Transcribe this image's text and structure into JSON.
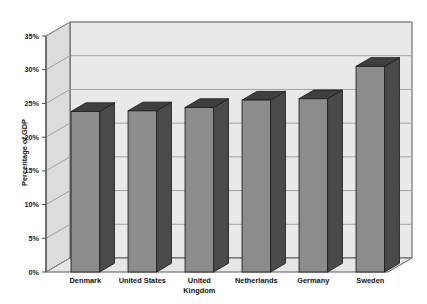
{
  "chart_data": {
    "type": "bar",
    "title": "",
    "subtitle": "",
    "xlabel": "",
    "ylabel": "Percentage of GDP",
    "categories": [
      "Denmark",
      "United States",
      "United Kingdom",
      "Netherlands",
      "Germany",
      "Sweden"
    ],
    "values": [
      23.8,
      23.9,
      24.4,
      25.5,
      25.7,
      30.5
    ],
    "ylim": [
      0,
      35
    ],
    "ytick_labels": [
      "0%",
      "5%",
      "10%",
      "15%",
      "20%",
      "25%",
      "30%",
      "35%"
    ],
    "ytick_values": [
      0,
      5,
      10,
      15,
      20,
      25,
      30,
      35
    ],
    "grid": true,
    "legend": false,
    "legend_position": "none",
    "style": "3d-column",
    "colors": {
      "bar_front": "#8c8c8c",
      "bar_side": "#4a4a4a",
      "bar_top": "#3f3f3f",
      "bar_outline": "#1f1f1f",
      "plot_back_wall": "#e8e8e6",
      "plot_left_wall": "#d8d8d6",
      "plot_floor": "#e4e4e2",
      "gridline": "#9a9a9a",
      "axis_line": "#4d4d4d",
      "background": "#ffffff",
      "text": "#111111"
    }
  },
  "axis": {
    "y_title": "Percentage of GDP",
    "ticks": [
      {
        "label": "35%",
        "value": 35
      },
      {
        "label": "30%",
        "value": 30
      },
      {
        "label": "25%",
        "value": 25
      },
      {
        "label": "20%",
        "value": 20
      },
      {
        "label": "15%",
        "value": 15
      },
      {
        "label": "10%",
        "value": 10
      },
      {
        "label": "5%",
        "value": 5
      },
      {
        "label": "0%",
        "value": 0
      }
    ]
  },
  "categories": [
    {
      "line1": "Denmark",
      "line2": ""
    },
    {
      "line1": "United States",
      "line2": ""
    },
    {
      "line1": "United",
      "line2": "Kingdom"
    },
    {
      "line1": "Netherlands",
      "line2": ""
    },
    {
      "line1": "Germany",
      "line2": ""
    },
    {
      "line1": "Sweden",
      "line2": ""
    }
  ]
}
